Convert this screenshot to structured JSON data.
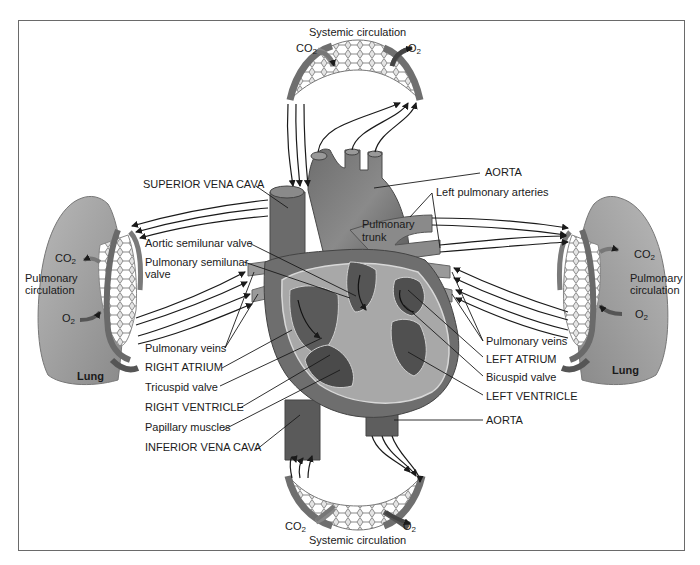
{
  "figure": {
    "colors": {
      "heart_dark": "#5a5a5a",
      "heart_mid": "#7d7d7d",
      "heart_light": "#b4b4b4",
      "heart_interior": "#a8a8a8",
      "lung": "#9a9a9a",
      "lung_light": "#c4c4c4",
      "capillary": "#d0d0d0",
      "line": "#1a1a1a",
      "frame": "#6a6a6a"
    }
  },
  "labels": {
    "systemic_top": "Systemic circulation",
    "systemic_bottom": "Systemic circulation",
    "co2": "CO",
    "o2": "O",
    "sub2": "2",
    "superior_vena_cava": "SUPERIOR VENA CAVA",
    "aorta_top": "AORTA",
    "left_pulmonary_arteries": "Left pulmonary arteries",
    "pulmonary_trunk_1": "Pulmonary",
    "pulmonary_trunk_2": "trunk",
    "aortic_semilunar_valve": "Aortic semilunar valve",
    "pulmonary_semilunar_valve_1": "Pulmonary semilunar",
    "pulmonary_semilunar_valve_2": "valve",
    "pulmonary_veins_left": "Pulmonary veins",
    "right_atrium": "RIGHT ATRIUM",
    "tricuspid_valve": "Tricuspid valve",
    "right_ventricle": "RIGHT VENTRICLE",
    "papillary_muscles": "Papillary muscles",
    "inferior_vena_cava": "INFERIOR VENA CAVA",
    "pulmonary_veins_right": "Pulmonary veins",
    "left_atrium": "LEFT ATRIUM",
    "bicuspid_valve": "Bicuspid valve",
    "left_ventricle": "LEFT VENTRICLE",
    "aorta_bottom": "AORTA",
    "pulmonary_circulation_left_1": "Pulmonary",
    "pulmonary_circulation_left_2": "circulation",
    "pulmonary_circulation_right_1": "Pulmonary",
    "pulmonary_circulation_right_2": "circulation",
    "lung_left": "Lung",
    "lung_right": "Lung"
  }
}
